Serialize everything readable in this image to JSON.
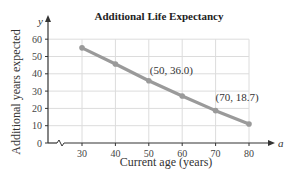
{
  "chart_data": {
    "type": "line",
    "title": "Additional Life Expectancy",
    "xlabel": "Current age (years)",
    "ylabel": "Additional years expected",
    "x_variable": "a",
    "y_variable": "y",
    "x": [
      30,
      40,
      50,
      60,
      70,
      80
    ],
    "series": [
      {
        "name": "Additional years expected",
        "values": [
          55.0,
          45.7,
          36.0,
          27.2,
          18.7,
          11.0
        ]
      }
    ],
    "x_ticks": [
      "30",
      "40",
      "50",
      "60",
      "70",
      "80"
    ],
    "y_ticks": [
      "0",
      "10",
      "20",
      "30",
      "40",
      "50",
      "60"
    ],
    "xlim": [
      20,
      85
    ],
    "ylim": [
      0,
      65
    ],
    "grid": true,
    "axis_break_on_x": true,
    "annotations": [
      {
        "text": "(50, 36.0)",
        "x": 50,
        "y": 36.0
      },
      {
        "text": "(70, 18.7)",
        "x": 70,
        "y": 18.7
      }
    ],
    "colors": {
      "line": "#9a9a9a",
      "grid": "#dcdcdc",
      "axis": "#333333"
    }
  }
}
